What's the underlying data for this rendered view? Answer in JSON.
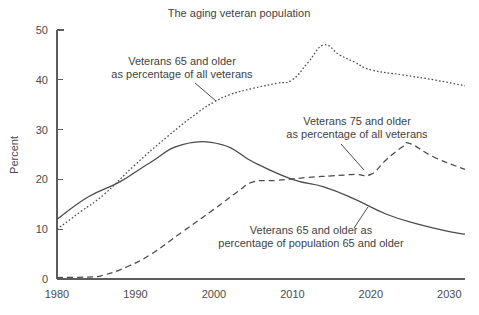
{
  "chart_data": {
    "type": "line",
    "title": "The aging veteran population",
    "xlabel": "",
    "ylabel": "Percent",
    "xlim": [
      1980,
      2032
    ],
    "ylim": [
      0,
      50
    ],
    "grid": false,
    "legend_position": "inline-annotations",
    "x_ticks": [
      "1980",
      "1990",
      "2000",
      "2010",
      "2020",
      "2030"
    ],
    "x_tick_values": [
      1980,
      1990,
      2000,
      2010,
      2020,
      2030
    ],
    "y_ticks": [
      "0",
      "10",
      "20",
      "30",
      "40",
      "50"
    ],
    "y_tick_values": [
      0,
      10,
      20,
      30,
      40,
      50
    ],
    "series": [
      {
        "name": "Veterans 65 and older as percentage of all veterans",
        "style": "dotted",
        "x": [
          1980,
          1983,
          1986,
          1990,
          1994,
          1998,
          2000,
          2002,
          2005,
          2008,
          2010,
          2012,
          2014,
          2016,
          2018,
          2020,
          2024,
          2028,
          2032
        ],
        "values": [
          10,
          13.5,
          17,
          23,
          28.5,
          33.5,
          35.5,
          37,
          38.3,
          39.3,
          40,
          43.5,
          47,
          45,
          43.5,
          42,
          41,
          40,
          38.8
        ]
      },
      {
        "name": "Veterans 65 and older as percentage of population 65 and older",
        "style": "solid",
        "x": [
          1980,
          1984,
          1988,
          1992,
          1996,
          2001,
          2005,
          2010,
          2014,
          2018,
          2022,
          2026,
          2030,
          2032
        ],
        "values": [
          12,
          16.5,
          19.5,
          23.5,
          27,
          27,
          23.5,
          20,
          18.5,
          16,
          13,
          11,
          9.5,
          9
        ]
      },
      {
        "name": "Veterans 75 and older as percentage of all veterans",
        "style": "dashed",
        "x": [
          1980,
          1984,
          1986,
          1989,
          1992,
          1996,
          2000,
          2003,
          2005,
          2008,
          2012,
          2015,
          2018,
          2020,
          2022,
          2024,
          2025,
          2028,
          2032
        ],
        "values": [
          0.3,
          0.4,
          0.8,
          2.5,
          5,
          9.5,
          14,
          17.5,
          19.5,
          19.8,
          20.4,
          20.7,
          21,
          21,
          24,
          26.5,
          27.2,
          24.5,
          22
        ]
      }
    ],
    "annotations": [
      {
        "id": "annot-65-of-all-veterans",
        "line1": "Veterans 65 and older",
        "line2": "as percentage of all veterans",
        "text_x": 182,
        "text_y1": 65,
        "text_y2": 78,
        "leader": "M 195 83 L 216 101"
      },
      {
        "id": "annot-75-of-all-veterans",
        "line1": "Veterans 75 and older",
        "line2": "as percentage of all veterans",
        "text_x": 357,
        "text_y1": 125,
        "text_y2": 138,
        "leader": "M 341 144 L 364 170"
      },
      {
        "id": "annot-65-of-population",
        "line1": "Veterans 65 and older as",
        "line2": "percentage of population 65 and older",
        "text_x": 311,
        "text_y1": 234,
        "text_y2": 247,
        "leader": "M 354 228 L 368 207"
      }
    ],
    "colors": {
      "line": "#4b4b4b",
      "axis": "#5d5d5d",
      "text": "#3f3f3f",
      "background": "#ffffff"
    }
  }
}
